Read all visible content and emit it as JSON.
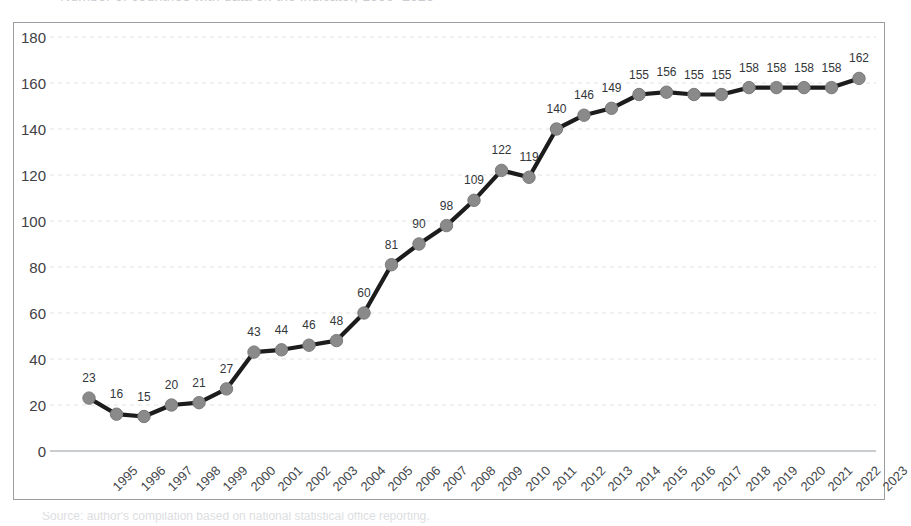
{
  "page": {
    "title_faint": "Number of countries with data on the indicator, 1995–2023",
    "caption_faint": "Source: author's compilation based on national statistical office reporting."
  },
  "axes": {
    "y_ticks": [
      "180",
      "160",
      "140",
      "120",
      "100",
      "80",
      "60",
      "40",
      "20",
      "0"
    ],
    "x_ticks": [
      "1995",
      "1996",
      "1997",
      "1998",
      "1999",
      "2000",
      "2001",
      "2002",
      "2003",
      "2004",
      "2005",
      "2006",
      "2007",
      "2008",
      "2009",
      "2010",
      "2011",
      "2012",
      "2013",
      "2014",
      "2015",
      "2016",
      "2017",
      "2018",
      "2019",
      "2020",
      "2021",
      "2022",
      "2023"
    ]
  },
  "style": {
    "line_color": "#1c1c1c",
    "marker_color": "#8a8a8a",
    "marker_edge_color": "#7a7a7a",
    "grid_color": "#e2e2e6",
    "axis_line_color": "#b9bcc0",
    "border_color": "#9a9ea3",
    "background": "#ffffff",
    "label_color": "#333639"
  },
  "chart_data": {
    "type": "line",
    "title": "",
    "xlabel": "",
    "ylabel": "",
    "ylim": [
      0,
      180
    ],
    "yticks": [
      0,
      20,
      40,
      60,
      80,
      100,
      120,
      140,
      160,
      180
    ],
    "grid": true,
    "legend": "none",
    "markers": true,
    "data_labels": true,
    "categories": [
      "1995",
      "1996",
      "1997",
      "1998",
      "1999",
      "2000",
      "2001",
      "2002",
      "2003",
      "2004",
      "2005",
      "2006",
      "2007",
      "2008",
      "2009",
      "2010",
      "2011",
      "2012",
      "2013",
      "2014",
      "2015",
      "2016",
      "2017",
      "2018",
      "2019",
      "2020",
      "2021",
      "2022",
      "2023"
    ],
    "values": [
      23,
      16,
      15,
      20,
      21,
      27,
      43,
      44,
      46,
      48,
      60,
      81,
      90,
      98,
      109,
      122,
      119,
      140,
      146,
      149,
      155,
      156,
      155,
      155,
      158,
      158,
      158,
      158,
      162
    ]
  }
}
